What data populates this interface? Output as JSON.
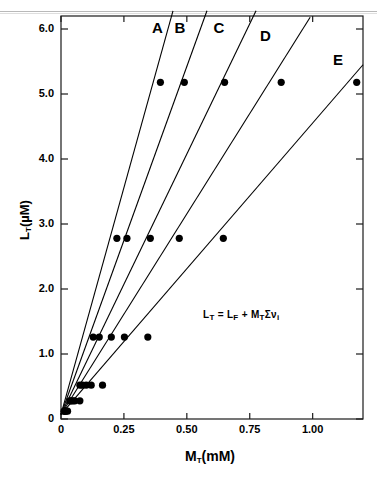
{
  "page": {
    "cut_header_text": "—————————"
  },
  "figure": {
    "equation": "Lᴛ = Lꟶ + Mᴛ Σνᵢ",
    "equation_parts": {
      "lt": "L",
      "lt_sub": "T",
      "eq": "=",
      "lf": "L",
      "lf_sub": "F",
      "plus": "+",
      "mt": "M",
      "mt_sub": "T",
      "sum": "Σν",
      "sum_sub": "i"
    }
  },
  "chart_data": {
    "type": "line",
    "title": "",
    "xlabel": "M_T (mM)",
    "ylabel": "L_T (µM)",
    "xlabel_parts": {
      "main": "M",
      "sub": "T",
      "unit": "(mM)"
    },
    "ylabel_parts": {
      "main": "L",
      "sub": "T",
      "unit": "(µM)"
    },
    "xlim": [
      0,
      1.2
    ],
    "ylim": [
      0,
      6.2
    ],
    "xticks": [
      0,
      0.25,
      0.5,
      0.75,
      1.0
    ],
    "xtick_labels": [
      "0",
      "0.25",
      "0.50",
      "0.75",
      "1.00"
    ],
    "yticks": [
      0,
      1.0,
      2.0,
      3.0,
      4.0,
      5.0,
      6.0
    ],
    "ytick_labels": [
      "0",
      "1.0",
      "2.0",
      "3.0",
      "4.0",
      "5.0",
      "6.0"
    ],
    "grid": false,
    "legend_position": "inline-curve-labels",
    "marker": "filled-circle",
    "marker_color": "#000000",
    "line_color": "#000000",
    "series": [
      {
        "name": "A",
        "label": "A",
        "label_x": 0.385,
        "label_y": 6.02,
        "slope": 14.9,
        "line_x": [
          0.0,
          0.445
        ],
        "line_y": [
          0.07,
          6.28
        ],
        "x": [
          0.012,
          0.035,
          0.075,
          0.128,
          0.222,
          0.395
        ],
        "y": [
          0.12,
          0.28,
          0.52,
          1.26,
          2.78,
          5.18
        ]
      },
      {
        "name": "B",
        "label": "B",
        "label_x": 0.475,
        "label_y": 6.02,
        "slope": 12.6,
        "line_x": [
          0.0,
          0.58
        ],
        "line_y": [
          0.07,
          6.28
        ],
        "x": [
          0.014,
          0.04,
          0.085,
          0.152,
          0.262,
          0.49
        ],
        "y": [
          0.12,
          0.28,
          0.52,
          1.26,
          2.78,
          5.18
        ]
      },
      {
        "name": "C",
        "label": "C",
        "label_x": 0.63,
        "label_y": 6.02,
        "slope": 9.9,
        "line_x": [
          0.0,
          0.775
        ],
        "line_y": [
          0.07,
          6.28
        ],
        "x": [
          0.016,
          0.047,
          0.1,
          0.2,
          0.355,
          0.65
        ],
        "y": [
          0.12,
          0.28,
          0.52,
          1.26,
          2.78,
          5.18
        ]
      },
      {
        "name": "D",
        "label": "D",
        "label_x": 0.815,
        "label_y": 5.9,
        "slope": 7.7,
        "line_x": [
          0.0,
          0.99
        ],
        "line_y": [
          0.07,
          6.18
        ],
        "x": [
          0.02,
          0.055,
          0.12,
          0.252,
          0.47,
          0.875
        ],
        "y": [
          0.12,
          0.28,
          0.52,
          1.26,
          2.78,
          5.18
        ]
      },
      {
        "name": "E",
        "label": "E",
        "label_x": 1.105,
        "label_y": 5.52,
        "slope": 4.45,
        "line_x": [
          0.0,
          1.2
        ],
        "line_y": [
          0.07,
          5.45
        ],
        "x": [
          0.026,
          0.075,
          0.165,
          0.345,
          0.645,
          1.175
        ],
        "y": [
          0.12,
          0.28,
          0.52,
          1.26,
          2.78,
          5.18
        ]
      }
    ],
    "annotation": "L_T = L_F + M_T Σν_i"
  }
}
